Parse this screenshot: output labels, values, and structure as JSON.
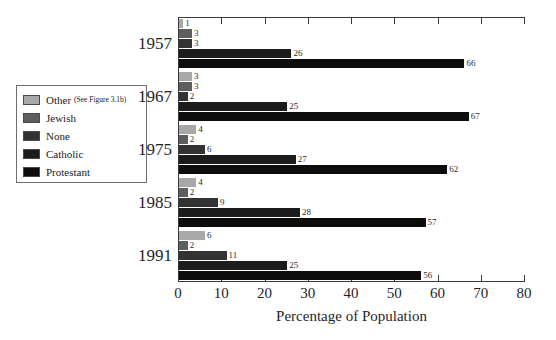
{
  "legend": {
    "items": [
      {
        "label": "Other",
        "note": "(See Figure 3.1b)",
        "color": "#a8a8a8"
      },
      {
        "label": "Jewish",
        "note": "",
        "color": "#5e5e5e"
      },
      {
        "label": "None",
        "note": "",
        "color": "#333333"
      },
      {
        "label": "Catholic",
        "note": "",
        "color": "#1c1c1c"
      },
      {
        "label": "Protestant",
        "note": "",
        "color": "#0d0d0d"
      }
    ]
  },
  "chart_data": {
    "type": "bar",
    "orientation": "horizontal",
    "title": "",
    "xlabel": "Percentage of Population",
    "ylabel": "",
    "xlim": [
      0,
      80
    ],
    "xticks": [
      0,
      10,
      20,
      30,
      40,
      50,
      60,
      70,
      80
    ],
    "grid": false,
    "legend_position": "left",
    "categories": [
      "1957",
      "1967",
      "1975",
      "1985",
      "1991"
    ],
    "series": [
      {
        "name": "Other",
        "color": "#a8a8a8",
        "values": [
          1,
          3,
          4,
          4,
          6
        ]
      },
      {
        "name": "Jewish",
        "color": "#5e5e5e",
        "values": [
          3,
          3,
          2,
          2,
          2
        ]
      },
      {
        "name": "None",
        "color": "#333333",
        "values": [
          3,
          2,
          6,
          9,
          11
        ]
      },
      {
        "name": "Catholic",
        "color": "#1c1c1c",
        "values": [
          26,
          25,
          27,
          28,
          25
        ]
      },
      {
        "name": "Protestant",
        "color": "#0d0d0d",
        "values": [
          66,
          67,
          62,
          57,
          56
        ]
      }
    ]
  }
}
